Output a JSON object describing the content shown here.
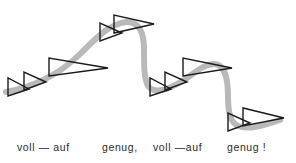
{
  "figure": {
    "width": 296,
    "height": 163,
    "background_color": "#ffffff",
    "contour_color": "#b9b9b9",
    "wedge_stroke_color": "#1a1a1a",
    "text_color": "#2a2a2a"
  },
  "caption": {
    "words": [
      {
        "text": "voll — auf",
        "id": "voll-auf-1"
      },
      {
        "text": "genug,",
        "id": "genug-1"
      },
      {
        "text": "voll —auf",
        "id": "voll-auf-2"
      },
      {
        "text": "genug !",
        "id": "genug-2"
      }
    ],
    "full_line": "voll — auf        genug,   voll —auf        genug !"
  },
  "chart_data": {
    "type": "line",
    "xlabel": "",
    "ylabel": "",
    "grid": false,
    "legend": null,
    "xlim": [
      0,
      296
    ],
    "ylim": [
      0,
      163
    ],
    "series": [
      {
        "name": "pitch-contour",
        "color": "#b9b9b9",
        "stroke_width": 6,
        "path": "M 6 92 C 30 88, 58 76, 80 54 C 98 36, 110 24, 126 22 C 140 21, 144 34, 144 50 C 144 66, 144 78, 148 86 C 154 94, 168 90, 184 80 C 196 72, 204 64, 214 64 C 224 64, 228 78, 228 96 C 228 112, 230 122, 238 126 C 248 130, 262 126, 280 120"
      }
    ],
    "wedges": [
      {
        "name": "wedge-1",
        "group": "voll-auf-1",
        "x": 8,
        "y_top": 78,
        "y_bottom": 96,
        "tip_x": 29,
        "tip_y": 89
      },
      {
        "name": "wedge-2",
        "group": "voll-auf-1",
        "x": 24,
        "y_top": 72,
        "y_bottom": 90,
        "tip_x": 46,
        "tip_y": 82
      },
      {
        "name": "wedge-3",
        "group": "voll-auf-1",
        "x": 49,
        "y_top": 58,
        "y_bottom": 76,
        "tip_x": 108,
        "tip_y": 68
      },
      {
        "name": "wedge-4",
        "group": "genug-1",
        "x": 100,
        "y_top": 23,
        "y_bottom": 41,
        "tip_x": 122,
        "tip_y": 33
      },
      {
        "name": "wedge-5",
        "group": "genug-1",
        "x": 114,
        "y_top": 15,
        "y_bottom": 33,
        "tip_x": 154,
        "tip_y": 24
      },
      {
        "name": "wedge-6",
        "group": "voll-auf-2",
        "x": 150,
        "y_top": 78,
        "y_bottom": 96,
        "tip_x": 171,
        "tip_y": 89
      },
      {
        "name": "wedge-7",
        "group": "voll-auf-2",
        "x": 165,
        "y_top": 72,
        "y_bottom": 90,
        "tip_x": 187,
        "tip_y": 82
      },
      {
        "name": "wedge-8",
        "group": "voll-auf-2",
        "x": 183,
        "y_top": 58,
        "y_bottom": 76,
        "tip_x": 232,
        "tip_y": 68
      },
      {
        "name": "wedge-9",
        "group": "genug-2",
        "x": 228,
        "y_top": 113,
        "y_bottom": 131,
        "tip_x": 250,
        "tip_y": 123
      },
      {
        "name": "wedge-10",
        "group": "genug-2",
        "x": 243,
        "y_top": 108,
        "y_bottom": 126,
        "tip_x": 284,
        "tip_y": 118
      }
    ]
  }
}
